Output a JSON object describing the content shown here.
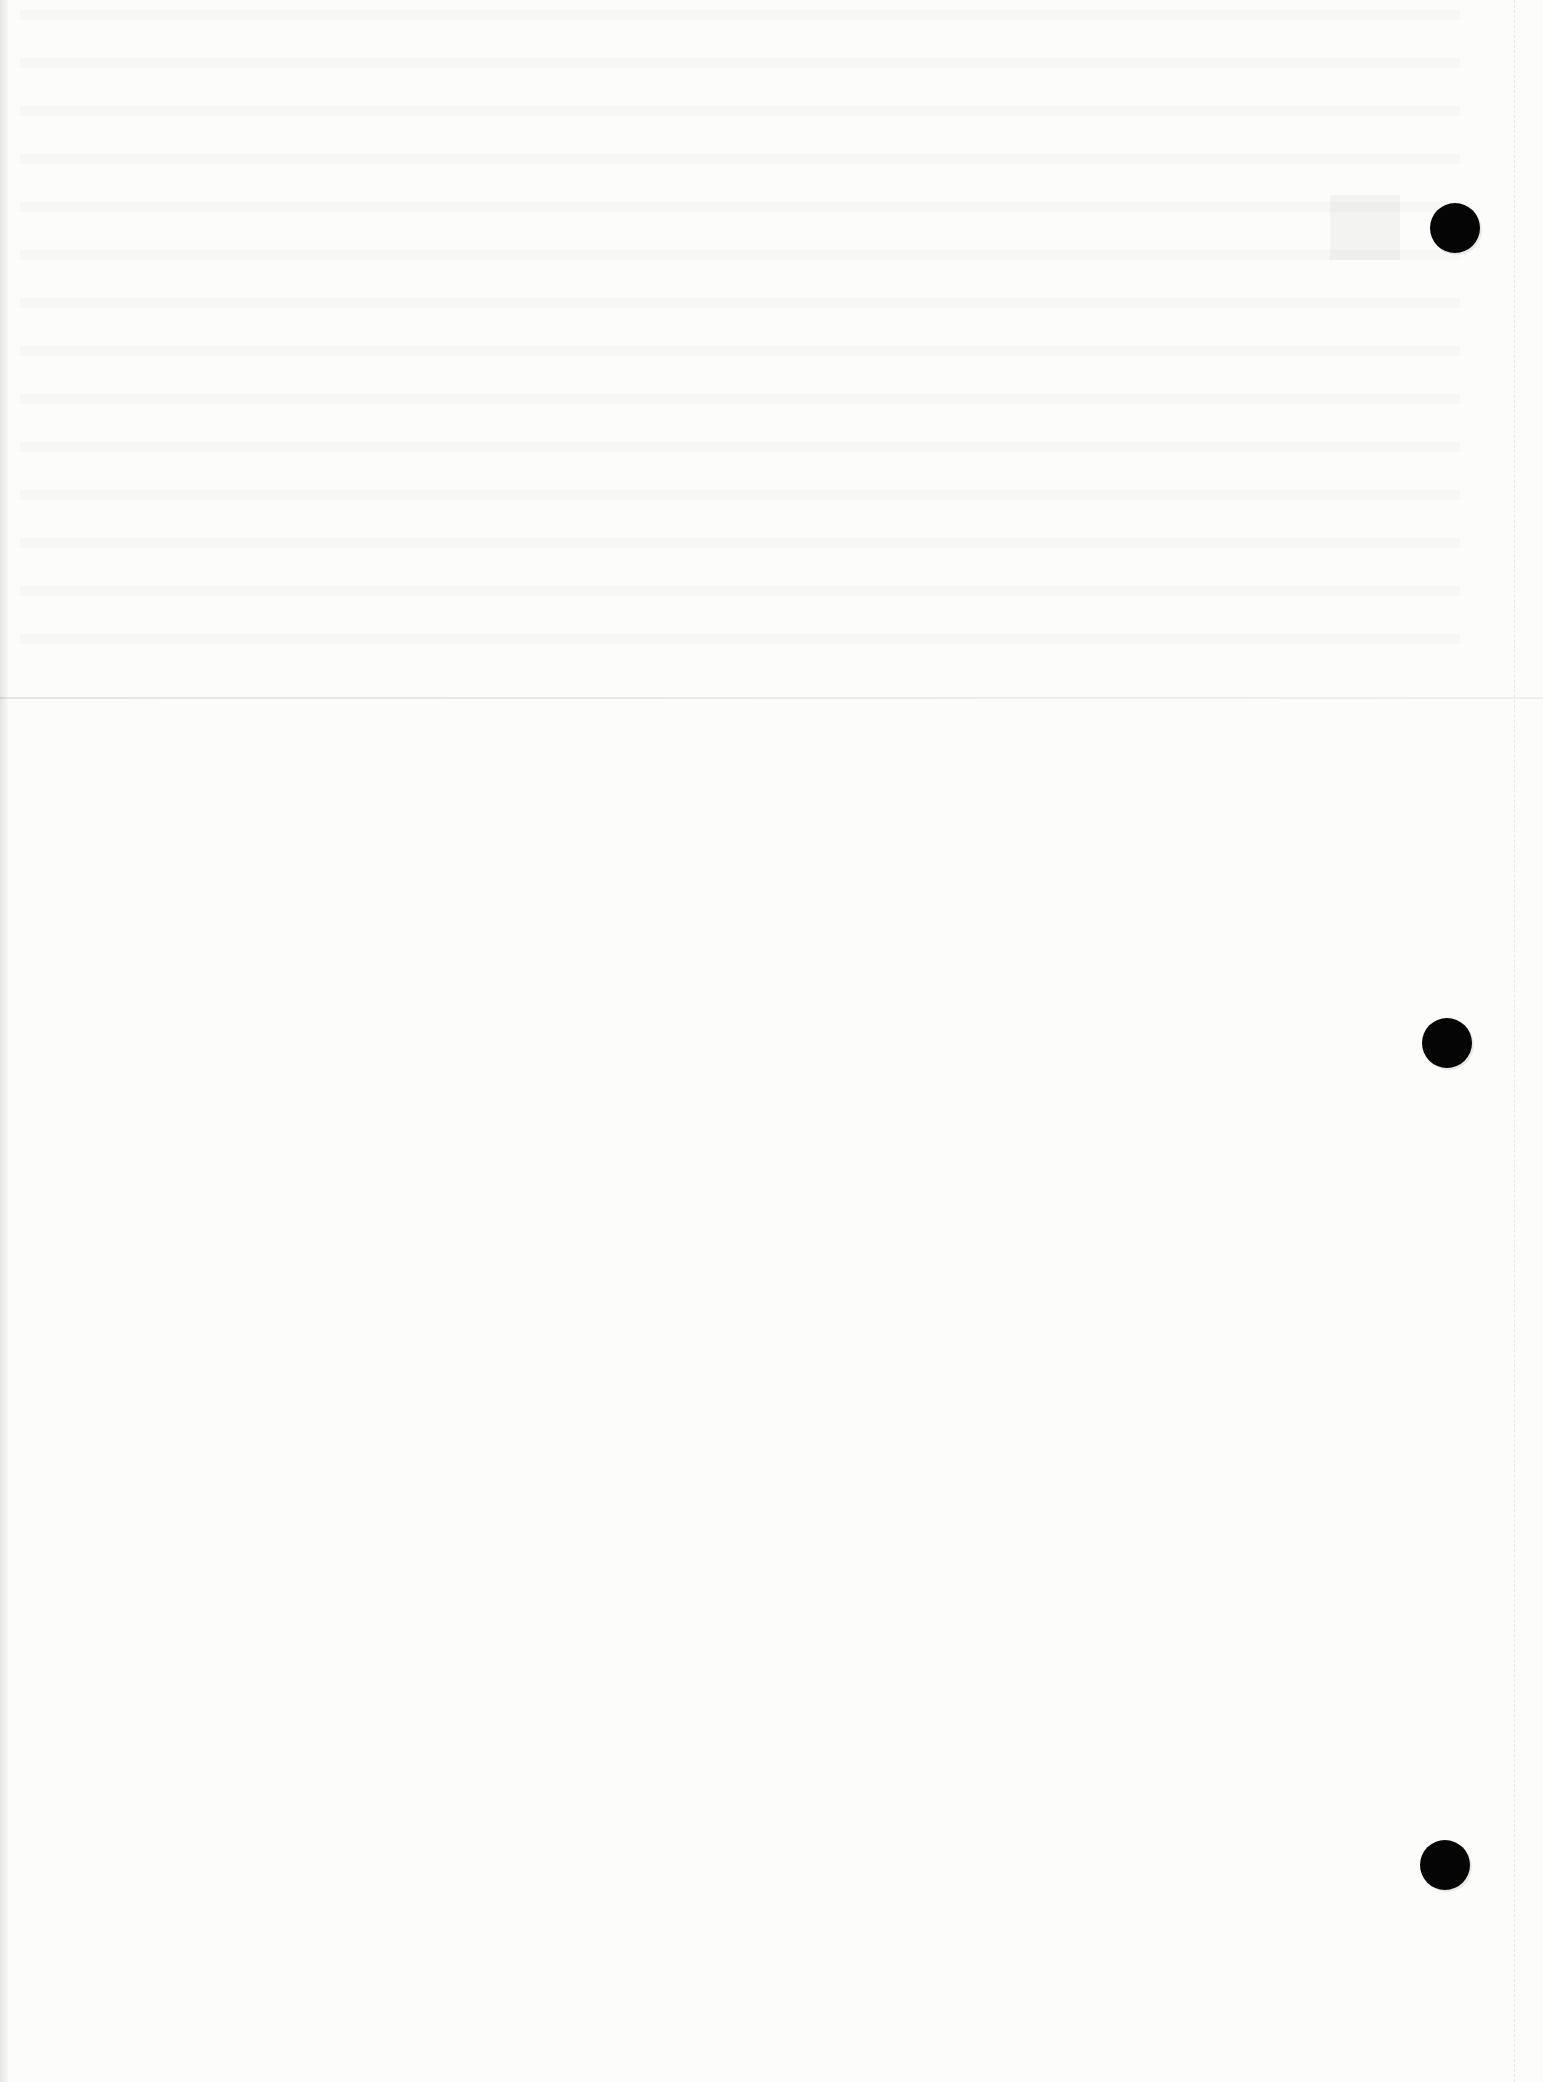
{
  "document": {
    "type": "scanned blank page",
    "text_content": "",
    "features": {
      "fold_line": true,
      "punch_holes": 3,
      "bleed_through_text": "illegible"
    },
    "colors": {
      "paper": "#fcfcfb",
      "punch_hole": "#050505"
    }
  }
}
